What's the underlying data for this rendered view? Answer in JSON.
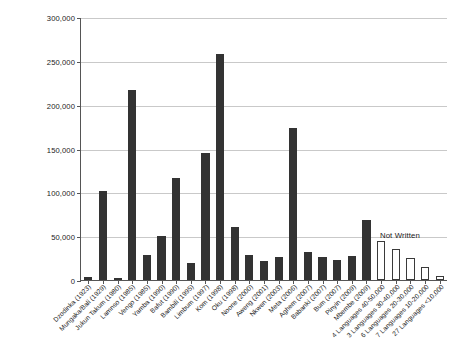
{
  "chart_data": {
    "type": "bar",
    "title": "",
    "xlabel": "",
    "ylabel": "Number of Mother Tongue Speakers",
    "ylim": [
      0,
      300000
    ],
    "ytick_values": [
      0,
      50000,
      100000,
      150000,
      200000,
      250000,
      300000
    ],
    "ytick_labels": [
      "0",
      "50,000",
      "100,000",
      "150,000",
      "200,000",
      "250,000",
      "300,000"
    ],
    "grid": true,
    "legend": "none",
    "annotations": [
      {
        "text": "Not Written",
        "x_category": "4 Languages 40-50,000",
        "y_value": 46000
      }
    ],
    "categories": [
      "Dzodinka (1923)",
      "Mungaka/Bali (1929)",
      "Jukun Takum (1980)",
      "Lamnso (1985)",
      "Vengo (1985)",
      "Yamba (1990)",
      "Bafut (1990)",
      "Bambili (1995)",
      "Limbum (1997)",
      "Kom (1998)",
      "Oku (1998)",
      "Noone (2000)",
      "Aweng (2001)",
      "Nkwen (2003)",
      "Meta (2006)",
      "Aghem (2007)",
      "Babanki (2007)",
      "Bum (2007)",
      "Pinyin (2009)",
      "Mbembe (2009)",
      "4 Languages 40-50,000",
      "3 Languages 30-40,000",
      "6 Languages 20-30,000",
      "7 Languages 10-20,000",
      "27 Languages <10,000"
    ],
    "values": [
      3000,
      101000,
      2500,
      217000,
      28000,
      50000,
      116000,
      19000,
      145000,
      258000,
      60000,
      28000,
      22000,
      26000,
      173000,
      32000,
      26000,
      23000,
      27000,
      69000,
      45000,
      35000,
      25000,
      15000,
      5000
    ],
    "series_groups": [
      {
        "name": "Written",
        "start_index": 0,
        "end_index": 19,
        "color": "#333333"
      },
      {
        "name": "Not Written",
        "start_index": 20,
        "end_index": 24,
        "color": "#ffffff"
      }
    ]
  }
}
